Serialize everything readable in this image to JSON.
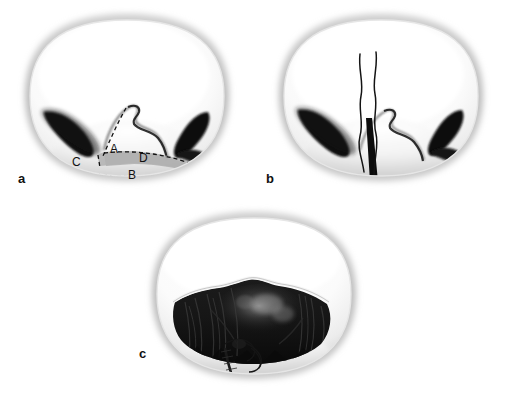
{
  "figure": {
    "type": "medical-illustration",
    "background_color": "#ffffff",
    "panel_count": 3
  },
  "panels": [
    {
      "id": "a",
      "label": "a",
      "caption": "Planned incision with measured flap dimensions",
      "measure_labels": [
        {
          "key": "A",
          "text": "A",
          "x": 110,
          "y": 153
        },
        {
          "key": "B",
          "text": "B",
          "x": 128,
          "y": 178
        },
        {
          "key": "C",
          "text": "C",
          "x": 74,
          "y": 166
        },
        {
          "key": "D",
          "text": "D",
          "x": 140,
          "y": 162
        }
      ],
      "shaded_region_color": "#b3b3b3",
      "dashed_line_color": "#1a1a1a"
    },
    {
      "id": "b",
      "label": "b",
      "caption": "Incision made with two suture threads placed",
      "incision_color": "#0b0b0b",
      "suture_color": "#121212",
      "suture_count": 2
    },
    {
      "id": "c",
      "label": "c",
      "caption": "Open surgical field with running closure suture line",
      "cavity_color": "#141414",
      "suture_color": "#111111"
    }
  ],
  "colors": {
    "tissue_light": "#fdfdfd",
    "tissue_shadow": "#d8d8d8",
    "rim_gray": "#bdbdbd",
    "outline_dark": "#111111",
    "shaded_flap": "#b3b3b3",
    "background": "#ffffff"
  }
}
